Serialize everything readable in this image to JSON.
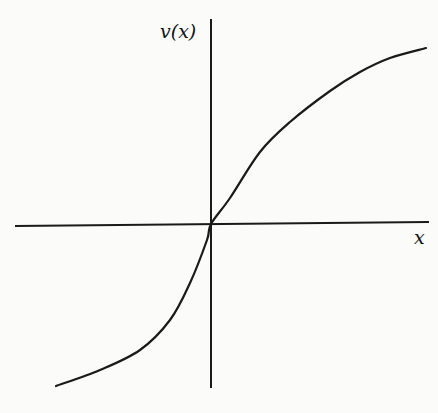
{
  "figure": {
    "y_label": "v(x)",
    "x_label": "x"
  },
  "chart_data": {
    "type": "line",
    "title": "",
    "xlabel": "x",
    "ylabel": "v(x)",
    "grid": false,
    "legend": "none",
    "axes_origin_px": [
      211,
      224
    ],
    "x_axis_px": {
      "from": [
        15,
        226
      ],
      "to": [
        429,
        222
      ]
    },
    "y_axis_px": {
      "from": [
        211,
        19
      ],
      "to": [
        211,
        388
      ]
    },
    "series": [
      {
        "name": "v(x)",
        "description": "increasing S-shaped (concave for x>0, convex for x<0) curve through origin; steeper for x<0",
        "points_px": [
          [
            56,
            386
          ],
          [
            100,
            370
          ],
          [
            140,
            350
          ],
          [
            170,
            320
          ],
          [
            190,
            283
          ],
          [
            207,
            240
          ],
          [
            211,
            224
          ],
          [
            230,
            198
          ],
          [
            260,
            152
          ],
          [
            290,
            122
          ],
          [
            330,
            91
          ],
          [
            360,
            72
          ],
          [
            390,
            58
          ],
          [
            426,
            48
          ]
        ]
      }
    ],
    "colors": {
      "axis": "#1a1a1a",
      "curve": "#1a1a1a",
      "background": "#fbfbfa"
    }
  }
}
